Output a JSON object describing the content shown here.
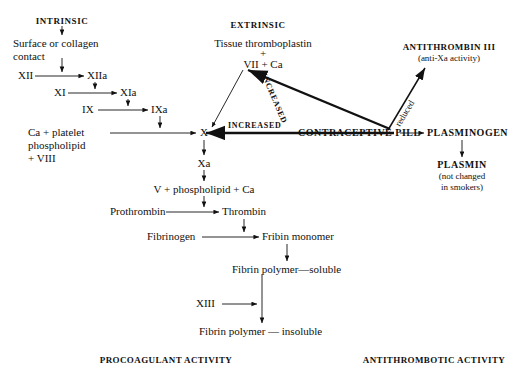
{
  "diagram": {
    "title_intrinsic": "INTRINSIC",
    "title_extrinsic": "EXTRINSIC",
    "nodes": {
      "surface_contact_l1": "Surface  or  collagen",
      "surface_contact_l2": "contact",
      "xii": "XII",
      "xiia": "XIIa",
      "xi": "XI",
      "xia": "XIa",
      "ix": "IX",
      "ixa": "IXa",
      "ca_platelet_l1": "Ca + platelet",
      "ca_platelet_l2": "phospholipid",
      "ca_platelet_l3": "+ VIII",
      "factor_x": "X",
      "factor_xa": "Xa",
      "tissue_thromboplastin": "Tissue  thromboplastin",
      "plus_sign": "+",
      "vii_ca": "VII + Ca",
      "contraceptive_pill": "CONTRACEPTIVE  PILL",
      "antithrombin_iii": "ANTITHROMBIN III",
      "anti_xa_activity": "(anti-Xa  activity)",
      "plasminogen": "PLASMINOGEN",
      "plasmin": "PLASMIN",
      "plasmin_note_l1": "(not changed",
      "plasmin_note_l2": "in smokers)",
      "v_phospholipid_ca": "V + phospholipid + Ca",
      "prothrombin": "Prothrombin",
      "thrombin": "Thrombin",
      "fibrinogen": "Fibrinogen",
      "fibrin_monomer": "Fribin monomer",
      "fibrin_polymer_soluble": "Fibrin polymer—soluble",
      "xiii": "XIII",
      "fibrin_polymer_insoluble": "Fibrin  polymer — insoluble"
    },
    "edge_labels": {
      "increased_horizontal": "INCREASED",
      "increased_diagonal": "INCREASED",
      "reduced_diagonal": "reduced"
    },
    "footers": {
      "procoagulant": "PROCOAGULANT ACTIVITY",
      "antithrombotic": "ANTITHROMBOTIC ACTIVITY"
    }
  },
  "colors": {
    "ink": "#111111",
    "background": "#ffffff"
  }
}
